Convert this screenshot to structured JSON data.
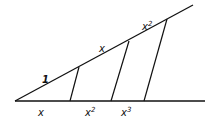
{
  "diagram": {
    "type": "geometric-construction",
    "colors": {
      "stroke": "#111111",
      "background": "#ffffff"
    },
    "vertex": [
      15,
      101
    ],
    "lines": {
      "baseline": {
        "from": [
          15,
          101
        ],
        "to": [
          205,
          101
        ]
      },
      "upper_ray": {
        "from": [
          15,
          101
        ],
        "to": [
          193,
          5
        ]
      }
    },
    "transversals": [
      {
        "from": [
          79,
          67
        ],
        "to": [
          70,
          101
        ]
      },
      {
        "from": [
          129,
          41
        ],
        "to": [
          111,
          101
        ]
      },
      {
        "from": [
          167,
          19
        ],
        "to": [
          144,
          101
        ]
      }
    ],
    "upper_labels": [
      {
        "base": "1",
        "sup": "",
        "x": 42,
        "y": 83
      },
      {
        "base": "x",
        "sup": "",
        "x": 99,
        "y": 52
      },
      {
        "base": "x",
        "sup": "2",
        "x": 142,
        "y": 30
      }
    ],
    "lower_labels": [
      {
        "base": "x",
        "sup": "",
        "x": 38,
        "y": 116
      },
      {
        "base": "x",
        "sup": "2",
        "x": 85,
        "y": 116
      },
      {
        "base": "x",
        "sup": "3",
        "x": 121,
        "y": 116
      }
    ]
  }
}
